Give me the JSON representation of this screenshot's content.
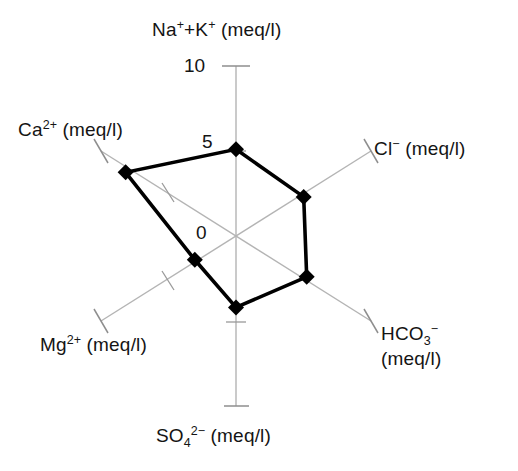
{
  "chart_data": {
    "type": "radar",
    "title": "",
    "subtitle": "",
    "xlabel": "",
    "ylabel": "",
    "grid": true,
    "legend": "none",
    "axis_min": 0,
    "axis_max": 10,
    "radial_tick_values": [
      0,
      5,
      10
    ],
    "radial_tick_labels": [
      "0",
      "5",
      "10"
    ],
    "unit": "meq/l",
    "categories": [
      "Na+ + K+ (meq/l)",
      "Cl- (meq/l)",
      "HCO3- (meq/l)",
      "SO4 2- (meq/l)",
      "Mg2+ (meq/l)",
      "Ca2+ (meq/l)"
    ],
    "values": [
      5.1,
      4.6,
      4.8,
      4.2,
      2.8,
      7.5
    ],
    "series": [
      {
        "name": "",
        "values": [
          5.1,
          4.6,
          4.8,
          4.2,
          2.8,
          7.5
        ]
      }
    ],
    "axis_angles_deg": [
      90,
      30,
      -30,
      -90,
      -150,
      150
    ],
    "colors": {
      "data_line": "#000000",
      "data_marker": "#000000",
      "axis_line": "#b4b4b4",
      "background": "#ffffff",
      "text": "#141414"
    }
  },
  "axes": {
    "na_k": {
      "element": "Na",
      "charge": "+",
      "plus": "+",
      "element2": "K",
      "charge2": "+",
      "unit": "(meq/l)"
    },
    "cl": {
      "element": "Cl",
      "charge": "−",
      "unit": "(meq/l)"
    },
    "hco3": {
      "element": "HCO",
      "sub": "3",
      "charge": "−",
      "unit": "(meq/l)"
    },
    "so4": {
      "element": "SO",
      "sub": "4",
      "charge": "2−",
      "unit": "(meq/l)"
    },
    "mg": {
      "element": "Mg",
      "charge": "2+",
      "unit": "(meq/l)"
    },
    "ca": {
      "element": "Ca",
      "charge": "2+",
      "unit": "(meq/l)"
    }
  },
  "ticks": {
    "top": "10",
    "mid": "5",
    "origin": "0"
  }
}
